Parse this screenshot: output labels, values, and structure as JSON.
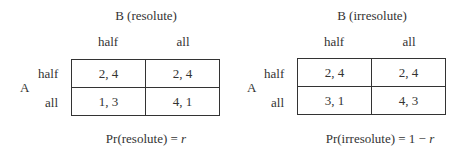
{
  "games": [
    {
      "title": "B (resolute)",
      "row_player": "A",
      "columns": [
        "half",
        "all"
      ],
      "rows": [
        {
          "label": "half",
          "cells": [
            "2, 4",
            "2, 4"
          ]
        },
        {
          "label": "all",
          "cells": [
            "1, 3",
            "4, 1"
          ]
        }
      ],
      "caption_prefix": "Pr(resolute) = ",
      "caption_var": "r"
    },
    {
      "title": "B (irresolute)",
      "row_player": "A",
      "columns": [
        "half",
        "all"
      ],
      "rows": [
        {
          "label": "half",
          "cells": [
            "2, 4",
            "2, 4"
          ]
        },
        {
          "label": "all",
          "cells": [
            "3, 1",
            "4, 3"
          ]
        }
      ],
      "caption_prefix": "Pr(irresolute) = 1 − ",
      "caption_var": "r"
    }
  ]
}
